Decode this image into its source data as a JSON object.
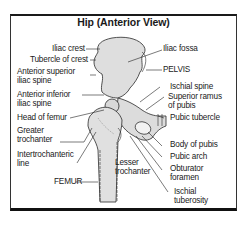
{
  "title": "Hip (Anterior View)",
  "labels": {
    "left": [
      {
        "text": "Iliac crest"
      },
      {
        "text": "Tubercle of crest"
      },
      {
        "line1": "Anterior superior",
        "line2": "iliac spine"
      },
      {
        "line1": "Anterior inferior",
        "line2": "iliac spine"
      },
      {
        "text": "Head of femur"
      },
      {
        "line1": "Greater",
        "line2": "trochanter"
      },
      {
        "line1": "Intertrochanteric",
        "line2": "line"
      },
      {
        "text": "FEMUR"
      }
    ],
    "center": [
      {
        "line1": "Lesser",
        "line2": "trochanter"
      }
    ],
    "right": [
      {
        "text": "Iliac fossa"
      },
      {
        "text": "PELVIS"
      },
      {
        "text": "Ischial spine"
      },
      {
        "line1": "Superior ramus",
        "line2": "of pubis"
      },
      {
        "text": "Pubic tubercle"
      },
      {
        "text": "Body of pubis"
      },
      {
        "text": "Pubic arch"
      },
      {
        "line1": "Obturator",
        "line2": "foramen"
      },
      {
        "line1": "Ischial",
        "line2": "tuberosity"
      }
    ]
  },
  "colors": {
    "bone_fill": "#dcdcdc",
    "outline": "#2a2a2a",
    "frame": "#111111"
  }
}
